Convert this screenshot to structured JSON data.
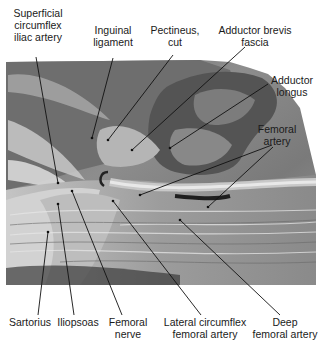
{
  "figure": {
    "type": "anatomical dissection photograph (grayscale)",
    "labels": {
      "superficial_circumflex_iliac_artery": "Superficial\ncircumflex\niliac artery",
      "inguinal_ligament": "Inguinal\nligament",
      "pectineus_cut": "Pectineus,\ncut",
      "adductor_brevis_fascia": "Adductor brevis\nfascia",
      "adductor_longus": "Adductor\nlongus",
      "femoral_artery": "Femoral\nartery",
      "sartorius": "Sartorius",
      "iliopsoas": "Iliopsoas",
      "femoral_nerve": "Femoral\nnerve",
      "lateral_circumflex_femoral_artery": "Lateral circumflex\nfemoral artery",
      "deep_femoral_artery": "Deep\nfemoral artery"
    },
    "colors": {
      "background": "#ffffff",
      "text": "#1a1a1a",
      "leader_line": "#111111"
    }
  }
}
